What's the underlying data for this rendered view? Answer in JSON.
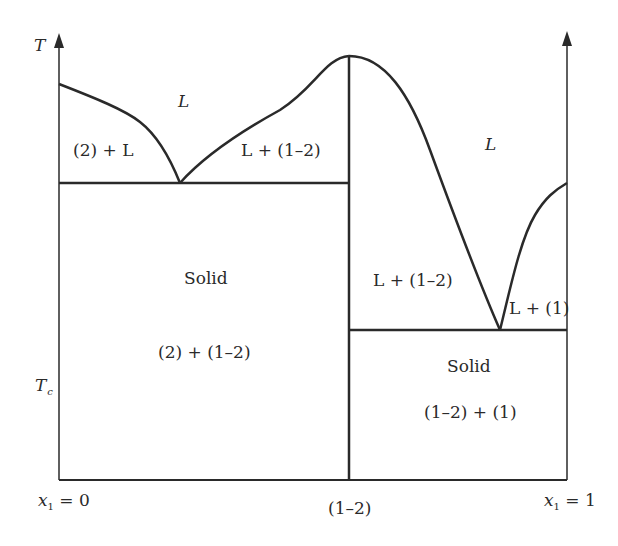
{
  "diagram": {
    "type": "phase-diagram",
    "axes": {
      "y_label": "T",
      "y_marker": "T",
      "y_marker_sub": "c",
      "x_left_label": "x",
      "x_left_sub": "1",
      "x_left_value": " = 0",
      "x_mid_label": "(1–2)",
      "x_right_label": "x",
      "x_right_sub": "1",
      "x_right_value": " = 1"
    },
    "regions": {
      "liquid_left": "L",
      "liquid_right": "L",
      "two_plus_L": "(2) + L",
      "L_plus_compound_left": "L + (1–2)",
      "L_plus_compound_right": "L + (1–2)",
      "L_plus_one": "L + (1)",
      "solid_left_title": "Solid",
      "solid_left_phases": "(2) + (1–2)",
      "solid_right_title": "Solid",
      "solid_right_phases": "(1–2) + (1)"
    },
    "colors": {
      "line": "#2a2a2a",
      "background": "#ffffff"
    }
  }
}
